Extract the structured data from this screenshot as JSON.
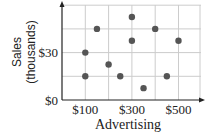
{
  "chart_data": {
    "type": "scatter",
    "title": "",
    "xlabel": "Advertising",
    "ylabel": "Sales (thousands)",
    "ylabel_lines": [
      "Sales",
      "(thousands)"
    ],
    "x_tick_labels": [
      "$100",
      "$300",
      "$500"
    ],
    "x_tick_values": [
      100,
      300,
      500
    ],
    "y_tick_labels": [
      "$0",
      "$30"
    ],
    "y_tick_values": [
      0,
      30
    ],
    "x_gridlines": [
      100,
      200,
      300,
      400,
      500
    ],
    "y_gridlines": [
      15,
      30,
      45,
      60
    ],
    "xlim": [
      0,
      580
    ],
    "ylim": [
      0,
      60
    ],
    "grid": true,
    "legend": null,
    "points": [
      {
        "x": 100,
        "y": 30
      },
      {
        "x": 100,
        "y": 15
      },
      {
        "x": 150,
        "y": 45
      },
      {
        "x": 200,
        "y": 22.5
      },
      {
        "x": 250,
        "y": 15
      },
      {
        "x": 300,
        "y": 52.5
      },
      {
        "x": 300,
        "y": 37.5
      },
      {
        "x": 350,
        "y": 7.5
      },
      {
        "x": 400,
        "y": 45
      },
      {
        "x": 450,
        "y": 15
      },
      {
        "x": 500,
        "y": 37.5
      }
    ],
    "colors": {
      "point": "#555555",
      "grid": "#cccccc",
      "axis": "#222222"
    }
  }
}
